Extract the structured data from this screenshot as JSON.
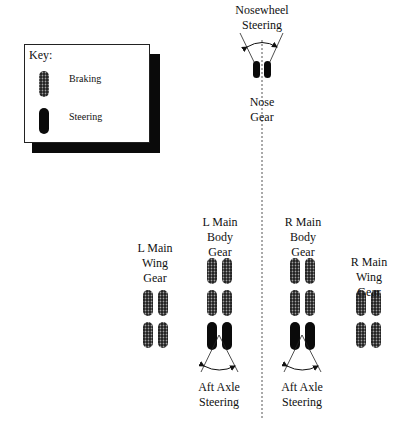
{
  "key": {
    "title": "Key:",
    "items": [
      {
        "label": "Braking",
        "symbol": "braking-tire"
      },
      {
        "label": "Steering",
        "symbol": "steering-tire"
      }
    ]
  },
  "labels": {
    "nosewheel_steering": "Nosewheel\nSteering",
    "nose_gear": "Nose\nGear",
    "l_main_wing": "L Main\nWing\nGear",
    "l_main_body": "L Main\nBody\nGear",
    "r_main_body": "R Main\nBody\nGear",
    "r_main_wing": "R Main\nWing\nGear",
    "aft_axle_left": "Aft Axle\nSteering",
    "aft_axle_right": "Aft Axle\nSteering"
  },
  "colors": {
    "steering_tire": "#0a0a0a",
    "braking_tire_base": "#222222",
    "braking_tire_dot": "#9a9a9a",
    "centerline": "#555555"
  }
}
